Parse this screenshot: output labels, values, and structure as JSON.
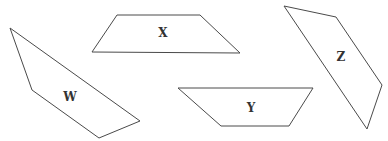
{
  "diagram": {
    "stroke_color": "#4a4a4a",
    "label_color": "#333333",
    "background": "#ffffff",
    "shapes": [
      {
        "id": "W",
        "label": "W",
        "points": "10,28 32,90 99,138 140,121",
        "label_pos": [
          70,
          97
        ]
      },
      {
        "id": "X",
        "label": "X",
        "points": "117,15 200,15 240,53 92,52",
        "label_pos": [
          163,
          33
        ]
      },
      {
        "id": "Y",
        "label": "Y",
        "points": "178,88 313,88 289,126 221,126",
        "label_pos": [
          251,
          108
        ]
      },
      {
        "id": "Z",
        "label": "Z",
        "points": "284,6 336,17 382,85 367,129",
        "label_pos": [
          341,
          57
        ]
      }
    ]
  }
}
